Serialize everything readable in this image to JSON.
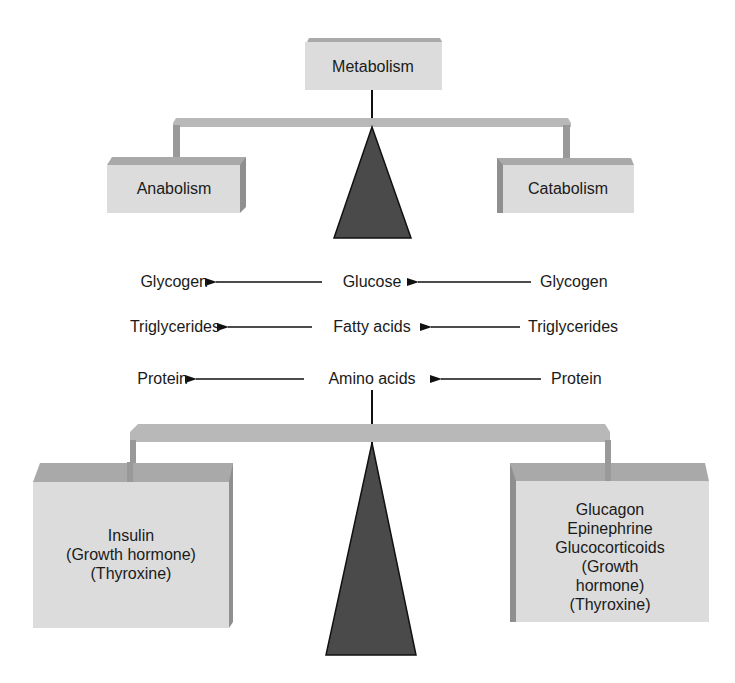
{
  "diagram": {
    "root": {
      "label": "Metabolism"
    },
    "upper_balance": {
      "left": {
        "label": "Anabolism"
      },
      "right": {
        "label": "Catabolism"
      }
    },
    "conversions": [
      {
        "anabolic_product": "Glycogen",
        "substrate": "Glucose",
        "catabolic_source": "Glycogen"
      },
      {
        "anabolic_product": "Triglycerides",
        "substrate": "Fatty acids",
        "catabolic_source": "Triglycerides"
      },
      {
        "anabolic_product": "Protein",
        "substrate": "Amino acids",
        "catabolic_source": "Protein"
      }
    ],
    "lower_balance": {
      "left": {
        "hormones": [
          "Insulin",
          "(Growth hormone)",
          "(Thyroxine)"
        ]
      },
      "right": {
        "hormones": [
          "Glucagon",
          "Epinephrine",
          "Glucocorticoids",
          "(Growth hormone)",
          "(Thyroxine)"
        ]
      }
    },
    "colors": {
      "box_face": "#dcdcdc",
      "box_top": "#a9a9a9",
      "box_side": "#8f8f8f",
      "beam": "#b8b8b8",
      "beam_leg": "#999999",
      "fulcrum": "#4a4a4a",
      "line": "#111111"
    }
  }
}
